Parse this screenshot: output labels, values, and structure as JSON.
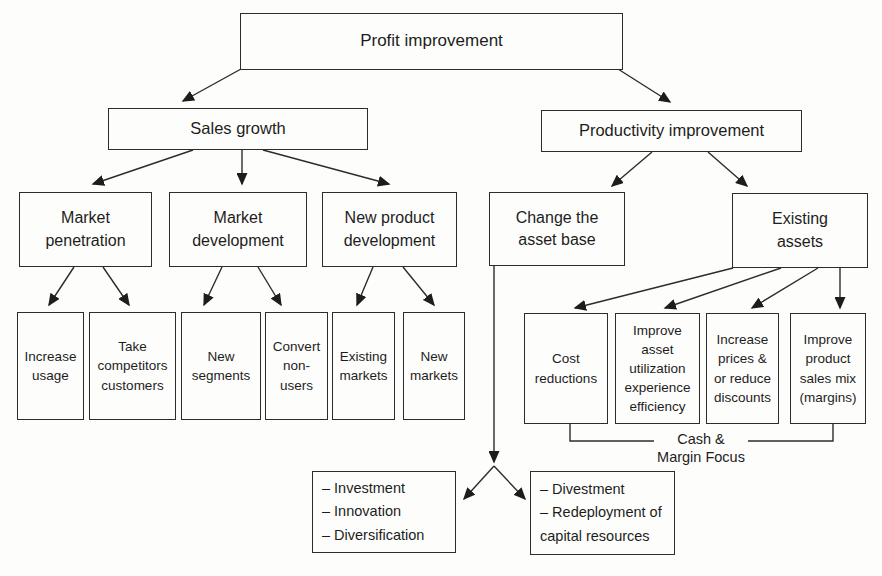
{
  "diagram": {
    "title": "Profit improvement",
    "nodes": {
      "profit": "Profit improvement",
      "sales_growth": "Sales growth",
      "productivity": "Productivity improvement",
      "market_penetration": "Market\npenetration",
      "market_development": "Market\ndevelopment",
      "new_product_development": "New product\ndevelopment",
      "change_asset_base": "Change the\nasset base",
      "existing_assets": "Existing\nassets",
      "increase_usage": "Increase\nusage",
      "take_competitors_customers": "Take\ncompetitors\ncustomers",
      "new_segments": "New\nsegments",
      "convert_non_users": "Convert\nnon-\nusers",
      "existing_markets": "Existing\nmarkets",
      "new_markets": "New\nmarkets",
      "cost_reductions": "Cost\nreductions",
      "improve_asset_utilization": "Improve\nasset\nutilization\nexperience\nefficiency",
      "increase_prices": "Increase\nprices &\nor reduce\ndiscounts",
      "improve_product_sales_mix": "Improve\nproduct\nsales mix\n(margins)",
      "investment_list": "– Investment\n– Innovation\n– Diversification",
      "divestment_list": "– Divestment\n– Redeployment of\ncapital resources"
    },
    "labels": {
      "cash_margin_focus": "Cash &\nMargin Focus"
    },
    "colors": {
      "line": "#2c2c2c",
      "arrowhead": "#1d1d1d",
      "background": "#fdfdfc",
      "text": "#1d1d1d"
    }
  }
}
